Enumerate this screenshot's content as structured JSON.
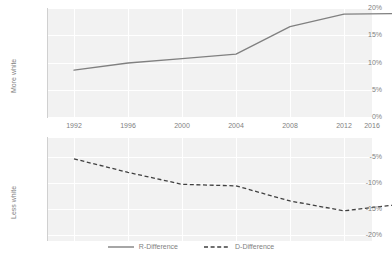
{
  "chart_data": {
    "type": "line",
    "title": "",
    "xlabel": "",
    "x": [
      1992,
      1996,
      2000,
      2004,
      2008,
      2012,
      2016
    ],
    "categories": [
      "1992",
      "1996",
      "2000",
      "2004",
      "2008",
      "2012",
      "2016"
    ],
    "grid": true,
    "legend_position": "bottom",
    "panels": [
      {
        "name": "top",
        "ylabel": "More white",
        "ylim": [
          0,
          20
        ],
        "yticks": [
          0,
          5,
          10,
          15,
          20
        ],
        "ytick_labels": [
          "0%",
          "5%",
          "10%",
          "15%",
          "20%"
        ],
        "series": [
          {
            "name": "R-Difference",
            "style": "solid",
            "color": "#808080",
            "values": [
              8.7,
              10.0,
              10.8,
              11.6,
              16.6,
              18.9,
              19.0
            ]
          }
        ]
      },
      {
        "name": "bottom",
        "ylabel": "Less white",
        "ylim": [
          -20,
          0
        ],
        "yticks": [
          -5,
          -10,
          -15,
          -20
        ],
        "ytick_labels": [
          "-5%",
          "-10%",
          "-15%",
          "-20%"
        ],
        "series": [
          {
            "name": "D-Difference",
            "style": "dashed",
            "color": "#404040",
            "values": [
              -4.2,
              -6.8,
              -9.1,
              -9.4,
              -12.3,
              -14.2,
              -13.0
            ]
          }
        ]
      }
    ]
  },
  "axes": {
    "top": {
      "ylabel": "More white",
      "ytick_labels": [
        "20%",
        "15%",
        "10%",
        "5%",
        "0%"
      ]
    },
    "bottom": {
      "ylabel": "Less white",
      "ytick_labels": [
        "-5%",
        "-10%",
        "-15%",
        "-20%"
      ]
    },
    "xtick_labels": [
      "1992",
      "1996",
      "2000",
      "2004",
      "2008",
      "2012",
      "2016"
    ]
  },
  "legend": {
    "items": [
      {
        "label": "R-Difference",
        "style": "solid",
        "color": "#808080"
      },
      {
        "label": "D-Difference",
        "style": "dashed",
        "color": "#404040"
      }
    ]
  }
}
